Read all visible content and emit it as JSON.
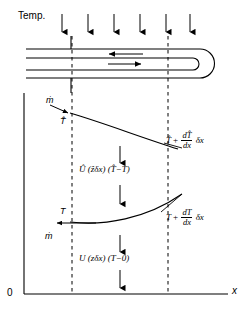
{
  "figure": {
    "type": "engineering-schematic",
    "axes": {
      "y_label": "Temp.",
      "origin_label": "0",
      "x_label": "x"
    },
    "tube": {
      "inner_flow_arrow_direction": "right",
      "outer_flow_arrow_direction": "left",
      "end_cap": "rounded"
    },
    "external_arrows": {
      "count": 6,
      "direction": "down"
    },
    "curves": {
      "upper": {
        "inlet_stream_label": "ṁ",
        "inlet_temp_label": "T̂",
        "outlet_formula_main": "T̂",
        "outlet_formula_plus": "+",
        "outlet_formula_num": "dT̂",
        "outlet_formula_den": "dx",
        "outlet_formula_tail": "δx"
      },
      "lower": {
        "inlet_stream_label": "ṁ",
        "inlet_temp_label": "T",
        "outlet_formula_main": "T",
        "outlet_formula_plus": "+",
        "outlet_formula_num": "dT",
        "outlet_formula_den": "dx",
        "outlet_formula_tail": "δx"
      }
    },
    "heat_terms": {
      "inner": "Û (ẑδx) (T̂−T)",
      "outer": "U (zδx) (T−0)"
    }
  }
}
